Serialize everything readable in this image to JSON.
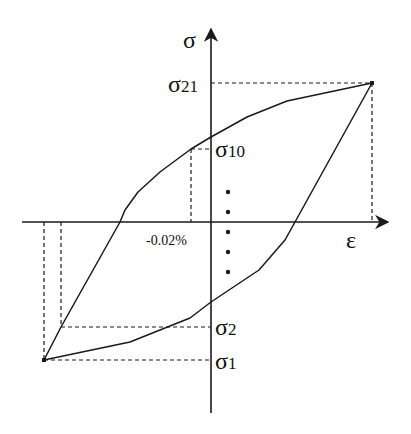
{
  "diagram": {
    "type": "hysteresis-loop",
    "colors": {
      "line": "#1a1a1a",
      "background": "#ffffff"
    },
    "axes": {
      "y_label": "σ",
      "x_label": "ε"
    },
    "labels": {
      "sigma21": {
        "base": "σ",
        "sub": "21"
      },
      "sigma10": {
        "base": "σ",
        "sub": "10"
      },
      "sigma2": {
        "base": "σ",
        "sub": "2"
      },
      "sigma1": {
        "base": "σ",
        "sub": "1"
      },
      "strain_tick": "-0.02%"
    },
    "ellipsis_dots": 5
  }
}
